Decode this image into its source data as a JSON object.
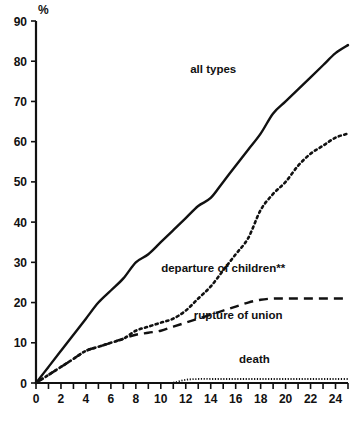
{
  "chart_data": {
    "type": "line",
    "title": "",
    "subtitle": "",
    "xlabel": "",
    "ylabel": "%",
    "xlim": [
      0,
      25
    ],
    "ylim": [
      0,
      90
    ],
    "grid": false,
    "legend_position": "inline-annotations",
    "x_ticks_all": [
      0,
      1,
      2,
      3,
      4,
      5,
      6,
      7,
      8,
      9,
      10,
      11,
      12,
      13,
      14,
      15,
      16,
      17,
      18,
      19,
      20,
      21,
      22,
      23,
      24,
      25
    ],
    "x_tick_labels": [
      "0",
      "2",
      "4",
      "6",
      "8",
      "10",
      "12",
      "14",
      "16",
      "18",
      "20",
      "22",
      "24"
    ],
    "x_tick_label_values": [
      0,
      2,
      4,
      6,
      8,
      10,
      12,
      14,
      16,
      18,
      20,
      22,
      24
    ],
    "y_tick_labels": [
      "0",
      "10",
      "20",
      "30",
      "40",
      "50",
      "60",
      "70",
      "80",
      "90"
    ],
    "y_tick_label_values": [
      0,
      10,
      20,
      30,
      40,
      50,
      60,
      70,
      80,
      90
    ],
    "x": [
      0,
      1,
      2,
      3,
      4,
      5,
      6,
      7,
      8,
      9,
      10,
      11,
      12,
      13,
      14,
      15,
      16,
      17,
      18,
      19,
      20,
      21,
      22,
      23,
      24,
      25
    ],
    "series": [
      {
        "name": "all types",
        "style": "solid",
        "label": "all types",
        "label_x": 14.2,
        "label_y": 77.0,
        "values": [
          0,
          4,
          8,
          12,
          16,
          20,
          23,
          26,
          30,
          32,
          35,
          38,
          41,
          44,
          46,
          50,
          54,
          58,
          62,
          67,
          70,
          73,
          76,
          79,
          82,
          84
        ]
      },
      {
        "name": "departure of children**",
        "style": "dotted",
        "label": "departure of children**",
        "label_x": 15.0,
        "label_y": 27.5,
        "values": [
          0,
          2,
          4,
          6,
          8,
          9,
          10,
          11,
          13,
          14,
          15,
          16,
          18,
          21,
          24,
          28,
          32,
          36,
          43,
          47,
          50,
          54,
          57,
          59,
          61,
          62
        ]
      },
      {
        "name": "rupture of union",
        "style": "dashed",
        "label": "rupture of union",
        "label_x": 16.2,
        "label_y": 16.0,
        "values": [
          0,
          2,
          4,
          6,
          8,
          9,
          10,
          11,
          12,
          12.5,
          13,
          14,
          15,
          16,
          17,
          18,
          19,
          20,
          20.7,
          21,
          21,
          21,
          21,
          21,
          21,
          21
        ]
      },
      {
        "name": "death",
        "style": "fine-dotted",
        "label": "death",
        "label_x": 17.5,
        "label_y": 5.0,
        "values": [
          0,
          0,
          0,
          0,
          0,
          0,
          0,
          0,
          0,
          0,
          0,
          0.1,
          0.8,
          1,
          1,
          1,
          1,
          1,
          1,
          1,
          1,
          1,
          1,
          1,
          1,
          1
        ]
      }
    ]
  }
}
